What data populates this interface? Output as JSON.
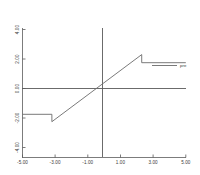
{
  "chart_data": {
    "type": "line",
    "title": "",
    "subtitle": "",
    "xlabel": "",
    "ylabel": "",
    "xlim": [
      -5.0,
      5.0
    ],
    "ylim": [
      -4.0,
      4.0
    ],
    "grid": false,
    "legend_position": "right",
    "x_ticks": [
      "-5.00",
      "-3.00",
      "-1.00",
      "1.00",
      "3.00",
      "5.00"
    ],
    "x_tick_values": [
      -5.0,
      -3.0,
      -1.0,
      1.0,
      3.0,
      5.0
    ],
    "y_ticks": [
      "4.00",
      "2.00",
      "0.00",
      "-2.00",
      "-4.00"
    ],
    "y_tick_values": [
      4.0,
      2.0,
      0.0,
      -2.0,
      -4.0
    ],
    "series": [
      {
        "name": "pre",
        "label": "pre",
        "color": "#6b6b6b",
        "x": [
          -5.0,
          -3.2,
          -3.2,
          2.3,
          2.3,
          5.0
        ],
        "y": [
          -1.75,
          -1.75,
          -2.25,
          2.3,
          1.75,
          1.75
        ]
      }
    ],
    "axis_color": "#5a5a5a",
    "line_color": "#6b6b6b",
    "annotations": []
  },
  "legend": {
    "entries": [
      {
        "label": "pre",
        "color": "#6b6b6b"
      }
    ]
  }
}
